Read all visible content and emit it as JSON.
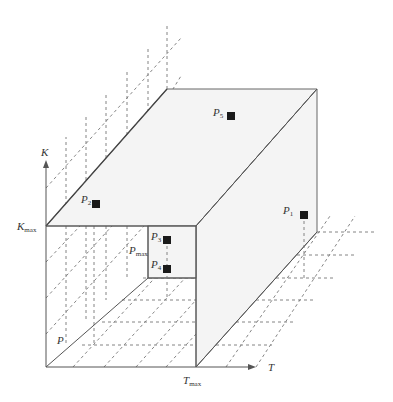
{
  "axes": {
    "k_axis_label": "K",
    "t_axis_label": "T",
    "k_max": {
      "base": "K",
      "sub": "max"
    },
    "t_max": {
      "base": "T",
      "sub": "max"
    },
    "p_max": {
      "base": "P",
      "sub": "max"
    },
    "p_label": "P"
  },
  "points": [
    {
      "id": "P1",
      "base": "P",
      "sub": "1"
    },
    {
      "id": "P2",
      "base": "P",
      "sub": "2"
    },
    {
      "id": "P3",
      "base": "P",
      "sub": "3"
    },
    {
      "id": "P4",
      "base": "P",
      "sub": "4"
    },
    {
      "id": "P5",
      "base": "P",
      "sub": "5"
    }
  ],
  "colors": {
    "face_fill": "#f4f4f4",
    "point_fill": "#1a1a1a",
    "line": "#555555"
  }
}
